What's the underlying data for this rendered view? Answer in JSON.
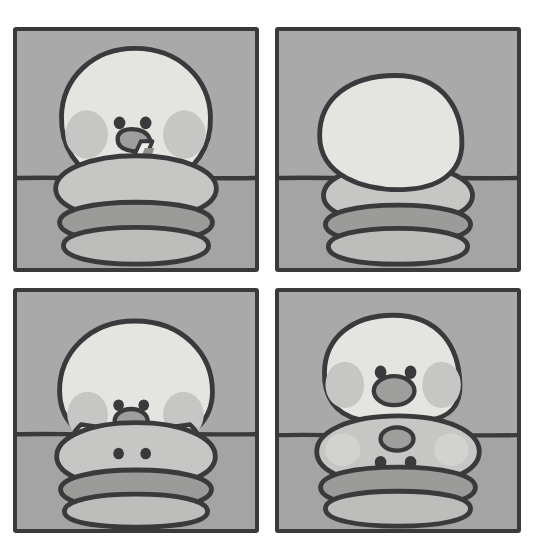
{
  "artwork": {
    "title": "Four-panel comic strip: chick drinking from a burger",
    "medium": "flat-color cartoon illustration, greyscale palette",
    "layout": {
      "rows": 2,
      "columns": 2,
      "canvas_width": 534,
      "canvas_height": 549,
      "page_background": "#ffffff",
      "panel_border_color": "#3a3a3c",
      "panel_border_width": 4,
      "gutter_horizontal": 17,
      "gutter_vertical": 16
    },
    "palette": {
      "page_background": "#ffffff",
      "sky_grey": "#a8a8a8",
      "ground_grey": "#a3a3a3",
      "ink": "#3a3a3c",
      "body_light": "#e3e3e0",
      "body_light_shadow": "#d5d5d2",
      "cheek_grey": "#c4c4c2",
      "bun_top": "#c5c5c3",
      "bun_bottom": "#bcbcba",
      "patty_dark": "#9a9a98",
      "beak_grey": "#9d9d9b",
      "straw_light": "#ededea",
      "straw_dark": "#8f8f8d"
    },
    "panels": [
      {
        "index": 1,
        "name": "panel-top-left",
        "caption": "Chick leans over a burger and sips through a striped straw",
        "x": 13,
        "y": 27,
        "width": 246,
        "height": 245,
        "horizon_y_ratio": 0.62,
        "elements": [
          "sky",
          "ground",
          "horizon-line",
          "chick-head",
          "left-cheek",
          "right-cheek",
          "left-eye",
          "right-eye",
          "beak",
          "striped-straw",
          "burger-top-bun",
          "burger-patty",
          "burger-bottom-bun"
        ]
      },
      {
        "index": 2,
        "name": "panel-top-right",
        "caption": "Blank round bun-head with no face sits on the burger stack",
        "x": 275,
        "y": 27,
        "width": 246,
        "height": 245,
        "horizon_y_ratio": 0.62,
        "elements": [
          "sky",
          "ground",
          "horizon-line",
          "blank-round-head",
          "burger-top-bun",
          "burger-patty",
          "burger-bottom-bun"
        ]
      },
      {
        "index": 3,
        "name": "panel-bottom-left",
        "caption": "Chick with face and spread wings; two small eyes appear on the bun below",
        "x": 13,
        "y": 288,
        "width": 246,
        "height": 245,
        "horizon_y_ratio": 0.6,
        "elements": [
          "sky",
          "ground",
          "horizon-line",
          "chick-head",
          "left-cheek",
          "right-cheek",
          "left-eye",
          "right-eye",
          "beak",
          "left-wing",
          "right-wing",
          "burger-top-bun",
          "bun-face-left-eye",
          "bun-face-right-eye",
          "burger-patty",
          "burger-bottom-bun"
        ]
      },
      {
        "index": 4,
        "name": "panel-bottom-right",
        "caption": "Chick fully formed; an upside-down face with beak and eyes is now on the bun",
        "x": 275,
        "y": 288,
        "width": 246,
        "height": 245,
        "horizon_y_ratio": 0.605,
        "elements": [
          "sky",
          "ground",
          "horizon-line",
          "chick-head",
          "left-cheek",
          "right-cheek",
          "left-eye",
          "right-eye",
          "beak",
          "burger-top-bun",
          "bun-face-beak",
          "bun-face-left-eye",
          "bun-face-right-eye",
          "bun-left-cheek",
          "bun-right-cheek",
          "burger-patty",
          "burger-bottom-bun"
        ]
      }
    ]
  }
}
